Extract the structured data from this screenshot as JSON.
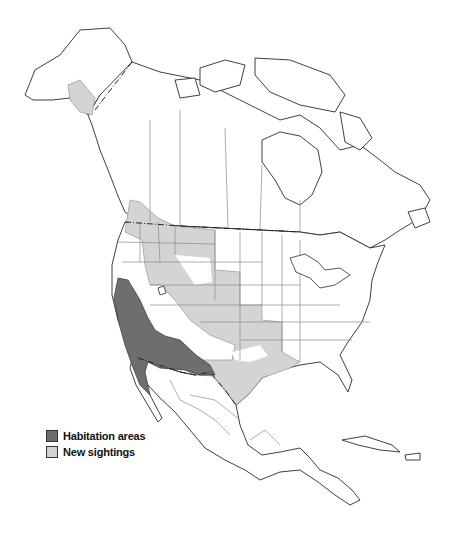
{
  "map": {
    "subject": "North America range map",
    "regions_shown": [
      "Alaska",
      "Canada",
      "United States",
      "Mexico",
      "Central America",
      "Caribbean"
    ]
  },
  "colors": {
    "habitation": "#6e6e6e",
    "sightings": "#d4d4d4",
    "land": "#ffffff",
    "outline": "#2a2a2a",
    "state_border": "#8a8a8a"
  },
  "legend": {
    "items": [
      {
        "label": "Habitation areas",
        "color": "#6e6e6e"
      },
      {
        "label": "New sightings",
        "color": "#d4d4d4"
      }
    ]
  }
}
